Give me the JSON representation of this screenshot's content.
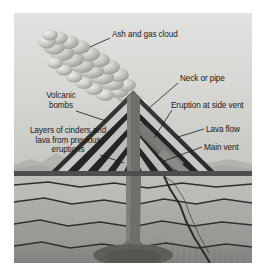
{
  "diagram": {
    "type": "labeled-cross-section",
    "palette": {
      "sky_top": "#dededc",
      "sky_bottom": "#c9c9c6",
      "cloud_light": "#e8e8e6",
      "cloud_mid": "#bdbdba",
      "cloud_dark": "#8f8f8c",
      "cone_dark": "#2b2b2b",
      "cone_light": "#c6c6c3",
      "ground_band": "#4a4a48",
      "strata_a": "#b6b6b3",
      "strata_b": "#a3a3a0",
      "strata_c": "#999996",
      "strata_d": "#8d8d8a",
      "conduit": "#6e6e6b",
      "magma": "#5a5a57",
      "line": "#1b1b1b",
      "text": "#1b1b1b",
      "page_bg": "#ffffff",
      "distant_hills": "#aeaeab",
      "plume_white": "#f2f2f0"
    },
    "labels": [
      {
        "id": "ash-and-gas-cloud",
        "name": "Ash and gas cloud",
        "lines": [
          "Ash and gas cloud"
        ],
        "side": "right",
        "x": 98,
        "y": 17,
        "leader": {
          "x1": 96,
          "y1": 25,
          "x2": 76,
          "y2": 34
        }
      },
      {
        "id": "volcanic-bombs",
        "name": "Volcanic bombs",
        "lines": [
          "Volcanic",
          "bombs"
        ],
        "side": "left",
        "x": 20,
        "y": 78,
        "leader": {
          "x1": 62,
          "y1": 98,
          "x2": 92,
          "y2": 108
        }
      },
      {
        "id": "layers-of-cinders",
        "name": "Layers of cinders and lava from previous eruptions",
        "lines": [
          "Layers of cinders and",
          "lava from previous",
          "eruptions"
        ],
        "side": "left",
        "x": 6,
        "y": 113,
        "leader": {
          "x1": 86,
          "y1": 142,
          "x2": 110,
          "y2": 150
        }
      },
      {
        "id": "neck-or-pipe",
        "name": "Neck or pipe",
        "lines": [
          "Neck or pipe"
        ],
        "side": "right",
        "x": 166,
        "y": 61,
        "leader": {
          "x1": 164,
          "y1": 70,
          "x2": 134,
          "y2": 96
        }
      },
      {
        "id": "eruption-at-side-vent",
        "name": "Eruption at side vent",
        "lines": [
          "Eruption at side vent"
        ],
        "side": "right",
        "x": 160,
        "y": 88,
        "leader": {
          "x1": 158,
          "y1": 97,
          "x2": 140,
          "y2": 125
        }
      },
      {
        "id": "lava-flow",
        "name": "Lava flow",
        "lines": [
          "Lava flow"
        ],
        "side": "right",
        "x": 192,
        "y": 112,
        "leader": {
          "x1": 190,
          "y1": 116,
          "x2": 164,
          "y2": 124
        }
      },
      {
        "id": "main-vent",
        "name": "Main vent",
        "lines": [
          "Main vent"
        ],
        "side": "right",
        "x": 190,
        "y": 130,
        "leader": {
          "x1": 188,
          "y1": 134,
          "x2": 150,
          "y2": 148
        }
      }
    ]
  }
}
